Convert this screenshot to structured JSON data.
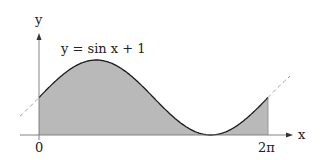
{
  "figure": {
    "function_label": "y = sin x + 1",
    "x_axis_label": "x",
    "y_axis_label": "y",
    "tick_labels": [
      "0",
      "2π"
    ],
    "colors": {
      "fill": "#b9b9b9",
      "curve": "#1a1a1a",
      "dashed": "#999999",
      "axis": "#555555"
    }
  },
  "chart_data": {
    "type": "area",
    "title": "y = sin x + 1",
    "xlabel": "x",
    "ylabel": "y",
    "function": "sin(x) + 1",
    "shaded_interval": [
      0,
      6.2832
    ],
    "x_ticks": [
      "0",
      "2π"
    ],
    "ylim": [
      0,
      2
    ],
    "grid": false
  }
}
